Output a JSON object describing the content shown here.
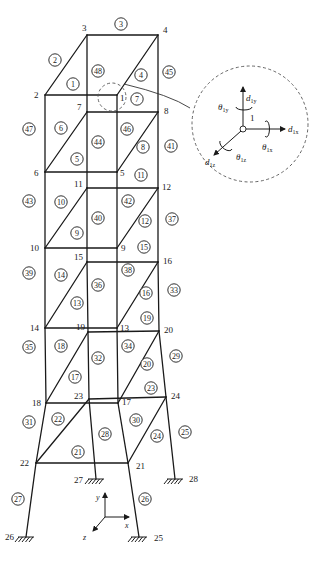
{
  "figure": {
    "nodes": [
      {
        "id": "1",
        "x": 117,
        "y": 95,
        "lx": 120,
        "ly": 101
      },
      {
        "id": "2",
        "x": 45,
        "y": 95,
        "lx": 34,
        "ly": 98
      },
      {
        "id": "3",
        "x": 87,
        "y": 35,
        "lx": 82,
        "ly": 31
      },
      {
        "id": "4",
        "x": 158,
        "y": 35,
        "lx": 163,
        "ly": 33
      },
      {
        "id": "5",
        "x": 117,
        "y": 172,
        "lx": 120,
        "ly": 176
      },
      {
        "id": "6",
        "x": 45,
        "y": 172,
        "lx": 34,
        "ly": 176
      },
      {
        "id": "7",
        "x": 87,
        "y": 112,
        "lx": 77,
        "ly": 110
      },
      {
        "id": "8",
        "x": 158,
        "y": 112,
        "lx": 164,
        "ly": 114
      },
      {
        "id": "9",
        "x": 117,
        "y": 248,
        "lx": 121,
        "ly": 251
      },
      {
        "id": "10",
        "x": 45,
        "y": 248,
        "lx": 30,
        "ly": 251
      },
      {
        "id": "11",
        "x": 87,
        "y": 188,
        "lx": 74,
        "ly": 187
      },
      {
        "id": "12",
        "x": 158,
        "y": 188,
        "lx": 162,
        "ly": 190
      },
      {
        "id": "13",
        "x": 117,
        "y": 328,
        "lx": 120,
        "ly": 331
      },
      {
        "id": "14",
        "x": 45,
        "y": 328,
        "lx": 30,
        "ly": 331
      },
      {
        "id": "15",
        "x": 87,
        "y": 262,
        "lx": 74,
        "ly": 260
      },
      {
        "id": "16",
        "x": 158,
        "y": 262,
        "lx": 163,
        "ly": 264
      },
      {
        "id": "17",
        "x": 118,
        "y": 403,
        "lx": 122,
        "ly": 405
      },
      {
        "id": "18",
        "x": 46,
        "y": 403,
        "lx": 32,
        "ly": 406
      },
      {
        "id": "19",
        "x": 88,
        "y": 332,
        "lx": 76,
        "ly": 330
      },
      {
        "id": "20",
        "x": 159,
        "y": 331,
        "lx": 164,
        "ly": 333
      },
      {
        "id": "21",
        "x": 128,
        "y": 463,
        "lx": 136,
        "ly": 469
      },
      {
        "id": "22",
        "x": 36,
        "y": 463,
        "lx": 20,
        "ly": 466
      },
      {
        "id": "23",
        "x": 89,
        "y": 399,
        "lx": 74,
        "ly": 399
      },
      {
        "id": "24",
        "x": 166,
        "y": 397,
        "lx": 171,
        "ly": 399
      },
      {
        "id": "25",
        "x": 139,
        "y": 537,
        "lx": 154,
        "ly": 541
      },
      {
        "id": "26",
        "x": 26,
        "y": 537,
        "lx": 5,
        "ly": 540
      },
      {
        "id": "27",
        "x": 96,
        "y": 479,
        "lx": 74,
        "ly": 483
      },
      {
        "id": "28",
        "x": 175,
        "y": 479,
        "lx": 189,
        "ly": 482
      }
    ],
    "members": [
      [
        "2",
        "3"
      ],
      [
        "3",
        "4"
      ],
      [
        "2",
        "1"
      ],
      [
        "1",
        "4"
      ],
      [
        "3",
        "7"
      ],
      [
        "4",
        "8"
      ],
      [
        "2",
        "6"
      ],
      [
        "1",
        "5"
      ],
      [
        "2",
        "6"
      ],
      [
        "7",
        "8"
      ],
      [
        "6",
        "5"
      ],
      [
        "6",
        "7"
      ],
      [
        "5",
        "8"
      ],
      [
        "7",
        "11"
      ],
      [
        "8",
        "12"
      ],
      [
        "6",
        "10"
      ],
      [
        "5",
        "9"
      ],
      [
        "11",
        "12"
      ],
      [
        "10",
        "9"
      ],
      [
        "10",
        "11"
      ],
      [
        "9",
        "12"
      ],
      [
        "11",
        "15"
      ],
      [
        "12",
        "16"
      ],
      [
        "10",
        "14"
      ],
      [
        "9",
        "13"
      ],
      [
        "15",
        "16"
      ],
      [
        "14",
        "13"
      ],
      [
        "14",
        "15"
      ],
      [
        "13",
        "16"
      ],
      [
        "15",
        "19"
      ],
      [
        "16",
        "20"
      ],
      [
        "14",
        "18"
      ],
      [
        "13",
        "17"
      ],
      [
        "19",
        "20"
      ],
      [
        "18",
        "17"
      ],
      [
        "18",
        "19"
      ],
      [
        "17",
        "20"
      ],
      [
        "19",
        "23"
      ],
      [
        "20",
        "24"
      ],
      [
        "18",
        "22"
      ],
      [
        "17",
        "21"
      ],
      [
        "23",
        "24"
      ],
      [
        "22",
        "21"
      ],
      [
        "22",
        "23"
      ],
      [
        "21",
        "24"
      ],
      [
        "22",
        "26"
      ],
      [
        "21",
        "25"
      ],
      [
        "23",
        "27"
      ],
      [
        "24",
        "28"
      ]
    ],
    "elements": [
      {
        "id": "1",
        "x": 73,
        "y": 84
      },
      {
        "id": "2",
        "x": 55,
        "y": 60
      },
      {
        "id": "3",
        "x": 121,
        "y": 24
      },
      {
        "id": "4",
        "x": 141,
        "y": 75
      },
      {
        "id": "5",
        "x": 77,
        "y": 159
      },
      {
        "id": "6",
        "x": 61,
        "y": 128
      },
      {
        "id": "7",
        "x": 137,
        "y": 99
      },
      {
        "id": "8",
        "x": 143,
        "y": 147
      },
      {
        "id": "9",
        "x": 77,
        "y": 233
      },
      {
        "id": "10",
        "x": 61,
        "y": 202
      },
      {
        "id": "11",
        "x": 141,
        "y": 175
      },
      {
        "id": "12",
        "x": 145,
        "y": 221
      },
      {
        "id": "13",
        "x": 77,
        "y": 303
      },
      {
        "id": "14",
        "x": 61,
        "y": 275
      },
      {
        "id": "15",
        "x": 144,
        "y": 247
      },
      {
        "id": "16",
        "x": 146,
        "y": 293
      },
      {
        "id": "17",
        "x": 75,
        "y": 377
      },
      {
        "id": "18",
        "x": 61,
        "y": 346
      },
      {
        "id": "19",
        "x": 147,
        "y": 318
      },
      {
        "id": "20",
        "x": 147,
        "y": 364
      },
      {
        "id": "21",
        "x": 78,
        "y": 452
      },
      {
        "id": "22",
        "x": 58,
        "y": 419
      },
      {
        "id": "23",
        "x": 151,
        "y": 388
      },
      {
        "id": "24",
        "x": 157,
        "y": 436
      },
      {
        "id": "25",
        "x": 185,
        "y": 432
      },
      {
        "id": "26",
        "x": 145,
        "y": 499
      },
      {
        "id": "27",
        "x": 18,
        "y": 499
      },
      {
        "id": "28",
        "x": 105,
        "y": 434
      },
      {
        "id": "29",
        "x": 176,
        "y": 356
      },
      {
        "id": "30",
        "x": 136,
        "y": 420
      },
      {
        "id": "31",
        "x": 29,
        "y": 422
      },
      {
        "id": "32",
        "x": 98,
        "y": 358
      },
      {
        "id": "33",
        "x": 174,
        "y": 290
      },
      {
        "id": "34",
        "x": 128,
        "y": 346
      },
      {
        "id": "35",
        "x": 29,
        "y": 347
      },
      {
        "id": "36",
        "x": 98,
        "y": 285
      },
      {
        "id": "37",
        "x": 172,
        "y": 219
      },
      {
        "id": "38",
        "x": 128,
        "y": 270
      },
      {
        "id": "39",
        "x": 29,
        "y": 273
      },
      {
        "id": "40",
        "x": 98,
        "y": 218
      },
      {
        "id": "41",
        "x": 171,
        "y": 146
      },
      {
        "id": "42",
        "x": 128,
        "y": 201
      },
      {
        "id": "43",
        "x": 29,
        "y": 201
      },
      {
        "id": "44",
        "x": 98,
        "y": 142
      },
      {
        "id": "45",
        "x": 169,
        "y": 72
      },
      {
        "id": "46",
        "x": 127,
        "y": 129
      },
      {
        "id": "47",
        "x": 29,
        "y": 129
      },
      {
        "id": "48",
        "x": 98,
        "y": 71
      }
    ],
    "supports": [
      "25",
      "26",
      "27",
      "28"
    ],
    "axes": {
      "x_label": "x",
      "y_label": "y",
      "z_label": "z"
    },
    "detail": {
      "node_label": "1",
      "dofs": {
        "dy": "d",
        "dy_sub": "1y",
        "dx": "d",
        "dx_sub": "1x",
        "dz": "d",
        "dz_sub": "1z",
        "ty": "θ",
        "ty_sub": "1y",
        "tx": "θ",
        "tx_sub": "1x",
        "tz": "θ",
        "tz_sub": "1z"
      }
    }
  }
}
